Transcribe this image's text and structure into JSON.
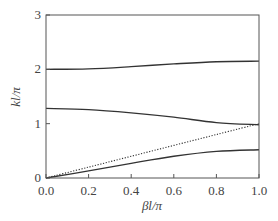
{
  "chart_data": {
    "type": "line",
    "title": "",
    "xlabel": "βl/π",
    "ylabel": "kl/π",
    "xlim": [
      0.0,
      1.0
    ],
    "ylim": [
      0,
      3
    ],
    "xticks": [
      "0.0",
      "0.2",
      "0.4",
      "0.6",
      "0.8",
      "1.0"
    ],
    "yticks": [
      "0",
      "1",
      "2",
      "3"
    ],
    "grid": false,
    "legend": null,
    "x": [
      0.0,
      0.2,
      0.4,
      0.6,
      0.8,
      1.0
    ],
    "series": [
      {
        "name": "band 3",
        "style": "solid",
        "values": [
          2.0,
          2.01,
          2.05,
          2.1,
          2.14,
          2.15
        ]
      },
      {
        "name": "band 2",
        "style": "solid",
        "values": [
          1.28,
          1.26,
          1.2,
          1.12,
          1.02,
          0.98
        ]
      },
      {
        "name": "light line",
        "style": "dotted",
        "values": [
          0.0,
          0.2,
          0.4,
          0.6,
          0.8,
          1.0
        ]
      },
      {
        "name": "band 1",
        "style": "solid",
        "values": [
          0.0,
          0.13,
          0.27,
          0.4,
          0.49,
          0.52
        ]
      }
    ]
  }
}
